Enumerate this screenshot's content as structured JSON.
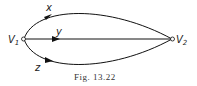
{
  "figure": {
    "caption": "Fig. 13.22",
    "vertices": [
      {
        "id": "V1",
        "label": "V",
        "sub": "1"
      },
      {
        "id": "V2",
        "label": "V",
        "sub": "2"
      }
    ],
    "edges": [
      {
        "label": "x",
        "from": "V1",
        "to": "V2",
        "shape": "upper-arc"
      },
      {
        "label": "y",
        "from": "V1",
        "to": "V2",
        "shape": "straight"
      },
      {
        "label": "z",
        "from": "V1",
        "to": "V2",
        "shape": "lower-arc"
      }
    ]
  }
}
